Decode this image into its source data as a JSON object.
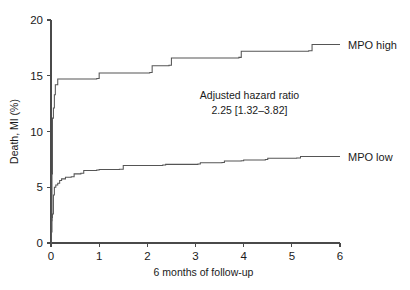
{
  "chart_data": {
    "type": "line",
    "subtype": "kaplan-meier-cumulative-event",
    "title": "",
    "xlabel": "6 months of follow-up",
    "ylabel": "Death, MI (%)",
    "xlim": [
      0,
      6
    ],
    "ylim": [
      0,
      20
    ],
    "xticks": [
      0,
      1,
      2,
      3,
      4,
      5,
      6
    ],
    "xticklabels": [
      "0",
      "1",
      "2",
      "3",
      "4",
      "5",
      "6"
    ],
    "yticks": [
      0,
      5,
      10,
      15,
      20
    ],
    "yticklabels": [
      "0",
      "5",
      "10",
      "15",
      "20"
    ],
    "grid": false,
    "legend_position": "inline-right-labels",
    "series": [
      {
        "name": "MPO high",
        "label": "MPO high",
        "label_x": 5.95,
        "label_y": 18.6,
        "color": "#555555",
        "points": [
          [
            0.0,
            0.0
          ],
          [
            0.01,
            2.0
          ],
          [
            0.02,
            6.2
          ],
          [
            0.03,
            11.2
          ],
          [
            0.05,
            12.1
          ],
          [
            0.07,
            13.3
          ],
          [
            0.09,
            14.2
          ],
          [
            0.14,
            14.7
          ],
          [
            0.95,
            14.75
          ],
          [
            1.0,
            15.25
          ],
          [
            2.05,
            15.3
          ],
          [
            2.1,
            15.9
          ],
          [
            2.45,
            15.95
          ],
          [
            2.5,
            16.6
          ],
          [
            3.9,
            16.65
          ],
          [
            3.95,
            17.2
          ],
          [
            5.35,
            17.25
          ],
          [
            5.42,
            17.8
          ],
          [
            6.0,
            17.8
          ]
        ]
      },
      {
        "name": "MPO low",
        "label": "MPO low",
        "label_x": 5.95,
        "label_y": 7.55,
        "color": "#555555",
        "points": [
          [
            0.0,
            0.0
          ],
          [
            0.01,
            1.0
          ],
          [
            0.02,
            2.3
          ],
          [
            0.03,
            2.6
          ],
          [
            0.05,
            4.3
          ],
          [
            0.07,
            5.0
          ],
          [
            0.1,
            5.2
          ],
          [
            0.14,
            5.35
          ],
          [
            0.18,
            5.6
          ],
          [
            0.22,
            5.75
          ],
          [
            0.3,
            5.9
          ],
          [
            0.42,
            5.95
          ],
          [
            0.48,
            6.2
          ],
          [
            0.62,
            6.25
          ],
          [
            0.68,
            6.5
          ],
          [
            0.95,
            6.55
          ],
          [
            1.0,
            6.6
          ],
          [
            1.42,
            6.62
          ],
          [
            1.5,
            6.95
          ],
          [
            2.32,
            7.0
          ],
          [
            2.38,
            7.05
          ],
          [
            3.05,
            7.08
          ],
          [
            3.1,
            7.2
          ],
          [
            3.55,
            7.22
          ],
          [
            3.6,
            7.35
          ],
          [
            3.95,
            7.38
          ],
          [
            4.0,
            7.45
          ],
          [
            4.45,
            7.48
          ],
          [
            4.5,
            7.6
          ],
          [
            5.1,
            7.62
          ],
          [
            5.18,
            7.75
          ],
          [
            6.0,
            7.75
          ]
        ]
      }
    ],
    "annotations": [
      {
        "name": "adjusted-hazard-ratio",
        "line1": "Adjusted hazard ratio",
        "line2": "2.25 [1.32–3.82]",
        "x": 4.12,
        "y_line1": 12.9,
        "y_line2": 11.55
      }
    ]
  }
}
